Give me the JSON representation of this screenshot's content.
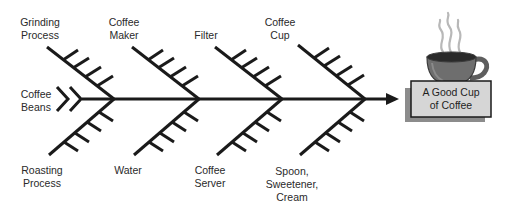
{
  "diagram": {
    "type": "fishbone",
    "effect": "A Good Cup\nof Coffee",
    "causes_top": [
      {
        "label": "Grinding\nProcess"
      },
      {
        "label": "Coffee\nMaker"
      },
      {
        "label": "Filter"
      },
      {
        "label": "Coffee\nCup"
      }
    ],
    "causes_bottom": [
      {
        "label": "Roasting\nProcess"
      },
      {
        "label": "Water"
      },
      {
        "label": "Coffee\nServer"
      },
      {
        "label": "Spoon,\nSweetener,\nCream"
      }
    ],
    "tail_label": "Coffee\nBeans",
    "icon": "coffee-cup-icon",
    "colors": {
      "line": "#1a1a1a",
      "box_fill": "#d6d6d6",
      "box_shadow": "#8c8c8c",
      "cup": "#6e6e6e",
      "coffee": "#2a2a2a",
      "steam": "#b8b8b8"
    }
  }
}
